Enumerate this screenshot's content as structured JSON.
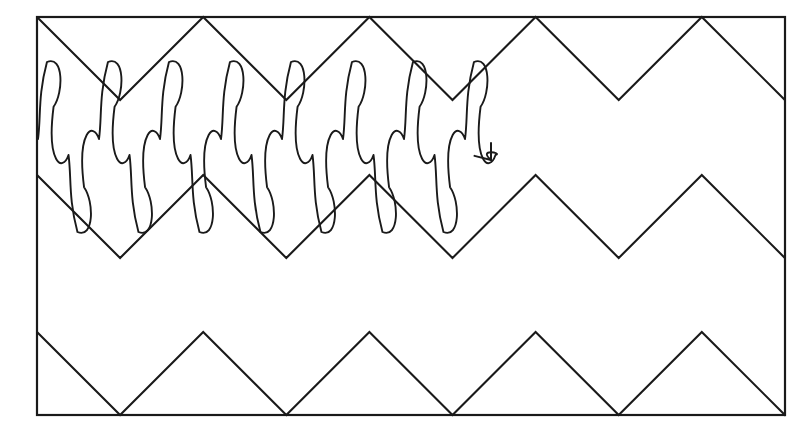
{
  "figure": {
    "background_color": "#ffffff",
    "stroke_color": "#1a1a1a",
    "canvas": {
      "width": 809,
      "height": 440
    },
    "frame": {
      "name": "outer-rectangle",
      "x": 37,
      "y": 17,
      "width": 748,
      "height": 398,
      "stroke_width": 2.2
    },
    "zigzags": [
      {
        "name": "top-zigzag",
        "label": "Top triangle wave",
        "start_x": 37,
        "end_x": 785,
        "peak_y": 17,
        "valley_y": 100,
        "period": 166.2,
        "phase": "descending-from-left-top-corner",
        "amplitude": 83,
        "peaks_x": [
          203,
          369,
          535,
          702
        ],
        "valleys_x": [
          120,
          286,
          452,
          618,
          785
        ],
        "stroke_width": 2.1
      },
      {
        "name": "middle-zigzag",
        "label": "Middle triangle wave",
        "start_x": 37,
        "end_x": 785,
        "peak_y": 175,
        "valley_y": 258,
        "period": 166.2,
        "phase": "descending-from-left-edge",
        "amplitude": 83,
        "peaks_x": [
          203,
          369,
          535,
          702
        ],
        "valleys_x": [
          120,
          286,
          452,
          618,
          785
        ],
        "stroke_width": 2.1
      },
      {
        "name": "bottom-zigzag",
        "label": "Bottom triangle wave",
        "start_x": 37,
        "end_x": 785,
        "peak_y": 332,
        "valley_y": 415,
        "period": 166.2,
        "phase": "descending-from-left-edge",
        "amplitude": 83,
        "peaks_x": [
          203,
          369,
          535,
          702
        ],
        "valleys_x": [
          120,
          286,
          452,
          618,
          785
        ],
        "stroke_width": 2.1
      }
    ],
    "coil": {
      "name": "looping-scribble-path",
      "label": "Continuous looped path overlaid on upper zigzags",
      "start_x": 38,
      "end_x": 482,
      "loop_count": 15,
      "loop_step": 30.5,
      "upper_loop_tip_y": 62,
      "lower_loop_tip_y": 232,
      "crossing_center_y": 147,
      "loop_half_width": 11,
      "stroke_width": 1.9,
      "direction": "left-to-right"
    },
    "arrow": {
      "name": "terminal-arrowhead",
      "label": "Arrowhead at end of looping path",
      "tip_x": 491,
      "tip_y": 160,
      "angle_degrees": 52,
      "length": 17,
      "spread_degrees": 38,
      "stroke_width": 2.0
    }
  }
}
